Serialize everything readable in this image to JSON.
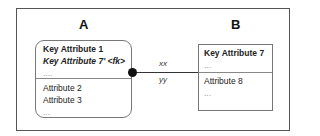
{
  "diagram": {
    "entity_a": {
      "title": "A",
      "key_section": [
        "Key Attribute 1",
        "Key Attribute 7' <fk>",
        "...."
      ],
      "attr_section": [
        "Attribute 2",
        "Attribute 3",
        "..."
      ]
    },
    "entity_b": {
      "title": "B",
      "key_section": [
        "Key Attribute 7",
        "..."
      ],
      "attr_section": [
        "Attribute 8",
        "..."
      ]
    },
    "relationship": {
      "label_top": "xx",
      "label_bottom": "yy"
    }
  }
}
